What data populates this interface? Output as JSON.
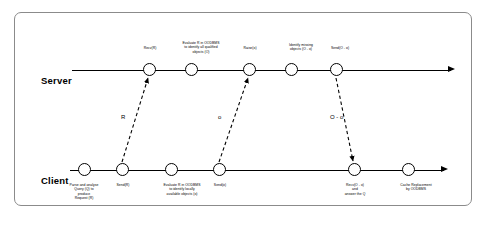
{
  "diagram": {
    "lanes": [
      {
        "name": "Server",
        "label": "Server"
      },
      {
        "name": "Client",
        "label": "Client"
      }
    ],
    "server_nodes": [
      {
        "id": "recv-r",
        "label": "Recv(R)",
        "x": 148
      },
      {
        "id": "evaluate-r-oodbms",
        "label": "Evaluate R in OODBMS\nto identify all qualified\nobjects (O)",
        "x": 190
      },
      {
        "id": "raise-o",
        "label": "Raise(o)",
        "x": 248
      },
      {
        "id": "identify-missing",
        "label": "Identify missing\nobjects (O - o)",
        "x": 290
      },
      {
        "id": "send-o-minus-o",
        "label": "Send(O - o)",
        "x": 335
      }
    ],
    "client_nodes": [
      {
        "id": "parse-analyse",
        "label": "Parse and analyse\nQuery (Q) to\nproduce\nRequest (R)",
        "x": 83
      },
      {
        "id": "send-r",
        "label": "Send(R)",
        "x": 121
      },
      {
        "id": "evaluate-r-locally",
        "label": "Evaluate R in OODBMS\nto identify locally\navailable objects (o)",
        "x": 170
      },
      {
        "id": "send-small-o",
        "label": "Send(o)",
        "x": 218
      },
      {
        "id": "recv-o-minus-o",
        "label": "Recv(O - o)\nand\nanswer the Q",
        "x": 353
      },
      {
        "id": "cache-replacement",
        "label": "Cache Replacement\nby OODBMS",
        "x": 407
      }
    ],
    "messages": [
      {
        "id": "message-r",
        "label": "R",
        "direction": "client-to-server"
      },
      {
        "id": "message-o",
        "label": "o",
        "direction": "client-to-server"
      },
      {
        "id": "message-o-minus-o",
        "label": "O - o",
        "direction": "server-to-client"
      }
    ],
    "colors": {
      "line": "#000000",
      "border": "#8b8b8b",
      "background": "#ffffff"
    }
  }
}
